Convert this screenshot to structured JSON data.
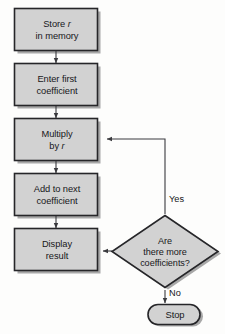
{
  "diagram": {
    "colors": {
      "node_fill": "#d2d2d2",
      "node_stroke": "#262629",
      "shadow": "#a8a8a8",
      "connector": "#3b3b3f",
      "text": "#17171a",
      "background": "#fdfdfc"
    },
    "nodes": [
      {
        "id": "store",
        "type": "process",
        "line1": "Store",
        "emphasis1": "r",
        "line2": "in memory"
      },
      {
        "id": "enter-first",
        "type": "process",
        "line1": "Enter first",
        "emphasis1": "",
        "line2": "coefficient"
      },
      {
        "id": "multiply",
        "type": "process",
        "line1": "Multiply",
        "emphasis1": "",
        "line2_prefix": "by",
        "emphasis2": "r"
      },
      {
        "id": "add-next",
        "type": "process",
        "line1": "Add to next",
        "emphasis1": "",
        "line2": "coefficient"
      },
      {
        "id": "display",
        "type": "process",
        "line1": "Display",
        "emphasis1": "",
        "line2": "result"
      },
      {
        "id": "decision",
        "type": "decision",
        "line1": "Are",
        "line2": "there more",
        "line3": "coefficients?"
      },
      {
        "id": "stop",
        "type": "terminal",
        "line1": "Stop"
      }
    ],
    "edge_labels": {
      "yes": "Yes",
      "no": "No"
    }
  }
}
